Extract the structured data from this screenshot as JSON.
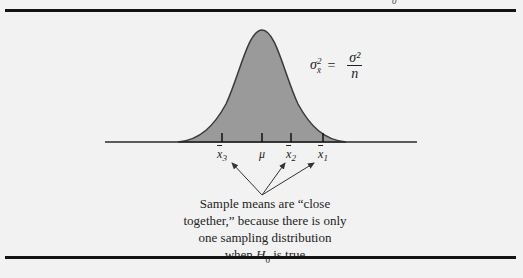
{
  "diagram": {
    "formula": {
      "lhs_symbol": "σ",
      "lhs_sub": "x̄",
      "lhs_sup": "2",
      "equals": "=",
      "numerator": "σ²",
      "denominator": "n"
    },
    "axis_labels": [
      {
        "id": "xbar3",
        "base": "x",
        "sub": "3",
        "x": 222
      },
      {
        "id": "mu",
        "base": "μ",
        "sub": "",
        "x": 262
      },
      {
        "id": "xbar2",
        "base": "x",
        "sub": "2",
        "x": 291
      },
      {
        "id": "xbar1",
        "base": "x",
        "sub": "1",
        "x": 323
      }
    ],
    "caption": {
      "line1": "Sample means are “close",
      "line2": "together,” because there is only",
      "line3": "one sampling distribution",
      "line4_pre": "when ",
      "line4_H": "H",
      "line4_sub": "0",
      "line4_post": " is true"
    },
    "top_mark": "0",
    "colors": {
      "background": "#f2f2f2",
      "curve_fill": "#9a9a9a",
      "curve_stroke": "#3a3a3a",
      "rule": "#141414",
      "axis": "#2a2a2a"
    }
  }
}
